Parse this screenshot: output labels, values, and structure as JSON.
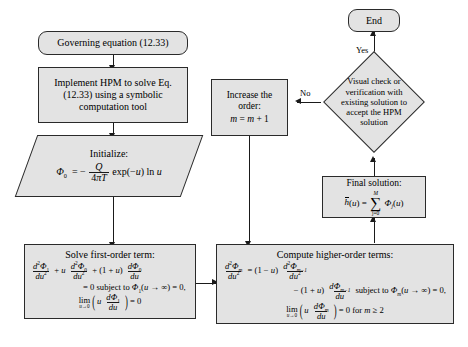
{
  "diagram": {
    "style": {
      "node_fill": "#e3e3e3",
      "node_border": "#2a2a2a",
      "background": "#ffffff"
    }
  },
  "nodes": {
    "governing": {
      "label": "Governing equation (12.33)",
      "shape": "rounded-rectangle"
    },
    "implement": {
      "line1": "Implement HPM to solve Eq.",
      "line2": "(12.33) using a symbolic",
      "line3": "computation tool",
      "shape": "rectangle"
    },
    "initialize": {
      "label": "Initialize:",
      "equation_plain": "Φ0 = − Q/(4πT) exp(−u) ln u",
      "phi": "Φ",
      "sub0": "0",
      "eq": "=",
      "minus": "−",
      "numerator": "Q",
      "denominator": "4πT",
      "tail": "exp(−u) ln u",
      "shape": "parallelogram"
    },
    "first_order": {
      "title": "Solve first-order term:",
      "eq_line1_plain": "d²Φ1/du² + u d²Φ0/du² + (1 + u) dΦ0/du",
      "eq_line2_plain": "= 0 subject to Φ1(u → ∞) = 0,",
      "eq_line3_plain": "lim(u→0) ( u dΦ1/du ) = 0",
      "shape": "rectangle"
    },
    "higher_order": {
      "title": "Compute higher-order terms:",
      "eq_line1_plain": "d²Φm/du² = (1 − u) d²Φm−1/du²",
      "eq_line2_plain": "− (1 + u) dΦm−1/du subject to Φm(u → ∞) = 0,",
      "eq_line3_plain": "lim(u→0) ( u dΦm/du ) = 0 for m ≥ 2",
      "shape": "rectangle"
    },
    "increase_order": {
      "line1": "Increase the",
      "line2": "order:",
      "line3_plain": "m = m + 1",
      "shape": "rectangle"
    },
    "final_solution": {
      "title": "Final solution:",
      "equation_plain": "h̄(u) = Σ (j=0 to M) Φj(u)",
      "sum_top": "M",
      "sum_bottom": "j=0",
      "shape": "rectangle"
    },
    "visual_check": {
      "line1": "Visual check or",
      "line2": "verification with",
      "line3": "existing solution to",
      "line4": "accept the HPM",
      "line5": "solution",
      "shape": "diamond"
    },
    "end": {
      "label": "End",
      "shape": "rounded-rectangle"
    }
  },
  "edge_labels": {
    "yes": "Yes",
    "no": "No"
  }
}
